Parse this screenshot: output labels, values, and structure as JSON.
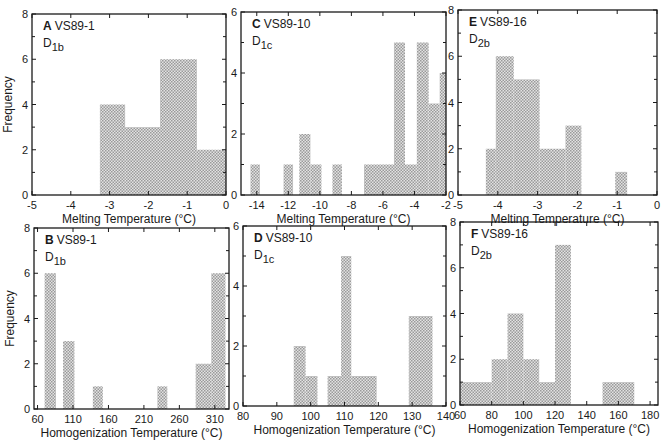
{
  "figure": {
    "hatch_color": "#8a8a8a",
    "axis_color": "#1a1a1a"
  },
  "chart_data": [
    {
      "id": "A",
      "type": "bar",
      "panel_letter": "A",
      "sample": "VS89-1",
      "subtitle_main": "D",
      "subtitle_sub": "1b",
      "xlabel": "Melting Temperature (°C)",
      "ylabel": "Frequency",
      "xlim": [
        -5,
        0
      ],
      "ylim": [
        0,
        8
      ],
      "xticks": [
        -5,
        -4,
        -3,
        -2,
        -1,
        0
      ],
      "yticks": [
        0,
        2,
        4,
        6,
        8
      ],
      "bins": [
        {
          "x0": -3.25,
          "x1": -2.6,
          "count": 4
        },
        {
          "x0": -2.6,
          "x1": -1.7,
          "count": 3
        },
        {
          "x0": -1.7,
          "x1": -0.75,
          "count": 6
        },
        {
          "x0": -0.75,
          "x1": 0,
          "count": 2
        }
      ],
      "frame": {
        "left": 32,
        "top": 14,
        "right": 226,
        "bottom": 195
      }
    },
    {
      "id": "C",
      "type": "bar",
      "panel_letter": "C",
      "sample": "VS89-10",
      "subtitle_main": "D",
      "subtitle_sub": "1c",
      "xlabel": "Melting Temperature (°C)",
      "ylabel": "",
      "xlim": [
        -15,
        -2
      ],
      "ylim": [
        0,
        6
      ],
      "xticks": [
        -14,
        -12,
        -10,
        -8,
        -6,
        -4,
        -2
      ],
      "yticks": [
        0,
        2,
        4,
        6
      ],
      "bins": [
        {
          "x0": -14.4,
          "x1": -13.8,
          "count": 1
        },
        {
          "x0": -12.3,
          "x1": -11.7,
          "count": 1
        },
        {
          "x0": -11.3,
          "x1": -10.6,
          "count": 2
        },
        {
          "x0": -10.6,
          "x1": -9.9,
          "count": 1
        },
        {
          "x0": -9.2,
          "x1": -8.6,
          "count": 1
        },
        {
          "x0": -7.2,
          "x1": -5.3,
          "count": 1
        },
        {
          "x0": -5.3,
          "x1": -4.6,
          "count": 5
        },
        {
          "x0": -4.6,
          "x1": -3.85,
          "count": 1
        },
        {
          "x0": -3.85,
          "x1": -3.1,
          "count": 5
        },
        {
          "x0": -3.1,
          "x1": -2.4,
          "count": 3
        },
        {
          "x0": -2.4,
          "x1": -2.0,
          "count": 4
        }
      ],
      "frame": {
        "left": 241,
        "top": 12,
        "right": 446,
        "bottom": 195
      }
    },
    {
      "id": "E",
      "type": "bar",
      "panel_letter": "E",
      "sample": "VS89-16",
      "subtitle_main": "D",
      "subtitle_sub": "2b",
      "xlabel": "Melting Temperature (°C)",
      "ylabel": "",
      "xlim": [
        -5,
        0
      ],
      "ylim": [
        0,
        8
      ],
      "xticks": [
        -5,
        -4,
        -3,
        -2,
        -1,
        0
      ],
      "yticks": [
        0,
        2,
        4,
        6,
        8
      ],
      "bins": [
        {
          "x0": -4.3,
          "x1": -4.05,
          "count": 2
        },
        {
          "x0": -4.05,
          "x1": -3.6,
          "count": 6
        },
        {
          "x0": -3.6,
          "x1": -2.95,
          "count": 5
        },
        {
          "x0": -2.95,
          "x1": -2.3,
          "count": 2
        },
        {
          "x0": -2.3,
          "x1": -1.9,
          "count": 3
        },
        {
          "x0": -1.05,
          "x1": -0.75,
          "count": 1
        }
      ],
      "frame": {
        "left": 458,
        "top": 10,
        "right": 657,
        "bottom": 195
      }
    },
    {
      "id": "B",
      "type": "bar",
      "panel_letter": "B",
      "sample": "VS89-1",
      "subtitle_main": "D",
      "subtitle_sub": "1b",
      "xlabel": "Homogenization Temperature (°C)",
      "ylabel": "Frequency",
      "xlim": [
        55,
        330
      ],
      "ylim": [
        0,
        8
      ],
      "xticks": [
        60,
        110,
        160,
        210,
        260,
        310
      ],
      "yticks": [
        0,
        2,
        4,
        6,
        8
      ],
      "bins": [
        {
          "x0": 70,
          "x1": 86,
          "count": 6
        },
        {
          "x0": 96,
          "x1": 112,
          "count": 3
        },
        {
          "x0": 138,
          "x1": 152,
          "count": 1
        },
        {
          "x0": 229,
          "x1": 243,
          "count": 1
        },
        {
          "x0": 283,
          "x1": 305,
          "count": 2
        },
        {
          "x0": 305,
          "x1": 325,
          "count": 6
        }
      ],
      "frame": {
        "left": 34,
        "top": 228,
        "right": 229,
        "bottom": 409
      }
    },
    {
      "id": "D",
      "type": "bar",
      "panel_letter": "D",
      "sample": "VS89-10",
      "subtitle_main": "D",
      "subtitle_sub": "1c",
      "xlabel": "Homogenization Temperature (°C)",
      "ylabel": "",
      "xlim": [
        80,
        140
      ],
      "ylim": [
        0,
        6
      ],
      "xticks": [
        80,
        90,
        100,
        110,
        120,
        130,
        140
      ],
      "yticks": [
        0,
        2,
        4,
        6
      ],
      "bins": [
        {
          "x0": 95,
          "x1": 98.5,
          "count": 2
        },
        {
          "x0": 98.5,
          "x1": 102,
          "count": 1
        },
        {
          "x0": 105,
          "x1": 109,
          "count": 1
        },
        {
          "x0": 109,
          "x1": 112,
          "count": 5
        },
        {
          "x0": 112,
          "x1": 119.5,
          "count": 1
        },
        {
          "x0": 129,
          "x1": 136,
          "count": 3
        }
      ],
      "frame": {
        "left": 243,
        "top": 226,
        "right": 446,
        "bottom": 406
      }
    },
    {
      "id": "F",
      "type": "bar",
      "panel_letter": "F",
      "sample": "VS89-16",
      "subtitle_main": "D",
      "subtitle_sub": "2b",
      "xlabel": "Homogenization Temperature (°C)",
      "ylabel": "",
      "xlim": [
        60,
        185
      ],
      "ylim": [
        0,
        8
      ],
      "xticks": [
        60,
        80,
        100,
        120,
        140,
        160,
        180
      ],
      "yticks": [
        0,
        2,
        4,
        6,
        8
      ],
      "bins": [
        {
          "x0": 60,
          "x1": 80,
          "count": 1
        },
        {
          "x0": 80,
          "x1": 90,
          "count": 2
        },
        {
          "x0": 90,
          "x1": 100,
          "count": 4
        },
        {
          "x0": 100,
          "x1": 110,
          "count": 2
        },
        {
          "x0": 110,
          "x1": 120,
          "count": 1
        },
        {
          "x0": 120,
          "x1": 130,
          "count": 7
        },
        {
          "x0": 150,
          "x1": 170,
          "count": 1
        }
      ],
      "frame": {
        "left": 460,
        "top": 222,
        "right": 658,
        "bottom": 405
      }
    }
  ]
}
